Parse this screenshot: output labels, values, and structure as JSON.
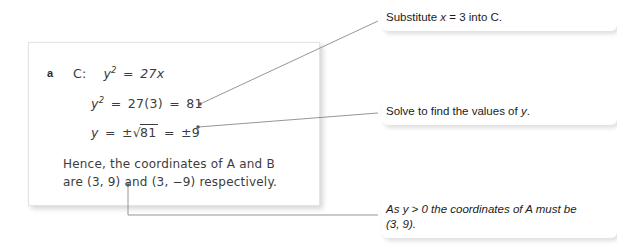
{
  "page": {
    "background_color": "#ffffff",
    "width": 617,
    "height": 246
  },
  "solution_card": {
    "part_label": "a",
    "equation_1": {
      "curve_label": "C:",
      "lhs": "y",
      "lhs_exponent": "2",
      "equals": "=",
      "rhs": "27x"
    },
    "equation_2": {
      "lhs": "y",
      "lhs_exponent": "2",
      "equals_1": "=",
      "middle": "27(3)",
      "equals_2": "=",
      "rhs": "81"
    },
    "equation_3": {
      "lhs": "y",
      "equals_1": "=",
      "plus_minus": "±",
      "radical_sign": "√",
      "radicand": "81",
      "equals_2": "=",
      "rhs_plus_minus": "±9"
    },
    "conclusion_line_1": "Hence, the coordinates of A and B",
    "conclusion_line_2": "are (3, 9) and (3, −9) respectively."
  },
  "annotations": [
    {
      "id": "substitute-annotation",
      "text_before_var": "Substitute ",
      "var": "x",
      "text_after_var": " = 3 into C."
    },
    {
      "id": "solve-annotation",
      "text_before_var": "Solve to find the values of ",
      "var": "y",
      "text_after_var": "."
    },
    {
      "id": "positive-root-annotation",
      "text_before_var": "As ",
      "var": "y",
      "text_after_var": " > 0 the coordinates of A must be",
      "second_line": "(3, 9)."
    }
  ],
  "leader_lines": {
    "line_color": "#8a8a8a",
    "count": 3
  }
}
